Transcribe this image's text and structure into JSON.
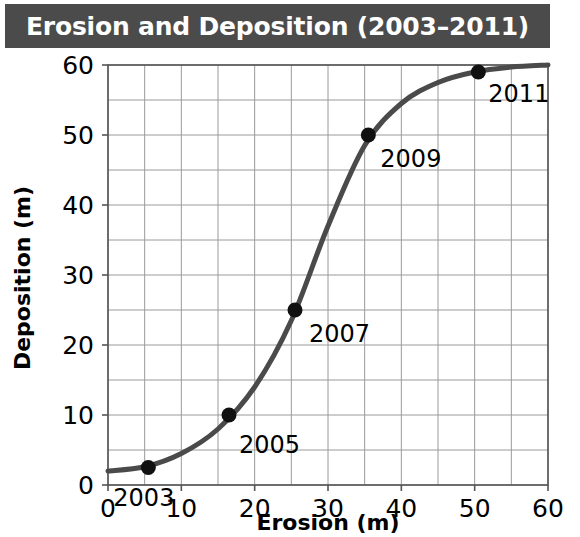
{
  "title": "Erosion and Deposition (2003–2011)",
  "colors": {
    "title_bar_bg": "#4b4b4b",
    "title_text": "#ffffff",
    "curve": "#4a4a4a",
    "point": "#111111",
    "grid": "#9a9a9a",
    "axis": "#555555",
    "background": "#ffffff"
  },
  "chart_data": {
    "type": "line",
    "title": "Erosion and Deposition (2003–2011)",
    "xlabel": "Erosion (m)",
    "ylabel": "Deposition (m)",
    "xlim": [
      0,
      60
    ],
    "ylim": [
      0,
      60
    ],
    "xticks": [
      0,
      10,
      20,
      30,
      40,
      50,
      60
    ],
    "yticks": [
      0,
      10,
      20,
      30,
      40,
      50,
      60
    ],
    "xtick_labels": [
      "0",
      "10",
      "20",
      "30",
      "40",
      "50",
      "60"
    ],
    "ytick_labels": [
      "0",
      "10",
      "20",
      "30",
      "40",
      "50",
      "60"
    ],
    "grid": true,
    "grid_minor_step": 5,
    "legend": "none",
    "series": [
      {
        "name": "Erosion vs Deposition",
        "curve_shape": "sigmoid",
        "x": [
          0,
          5,
          10,
          15,
          20,
          25,
          30,
          35,
          40,
          45,
          50,
          55,
          60
        ],
        "y": [
          2,
          2.6,
          4.5,
          8.0,
          14.0,
          23.5,
          37.0,
          48.5,
          54.5,
          57.5,
          59.0,
          59.7,
          60.0
        ]
      }
    ],
    "points": [
      {
        "label": "2003",
        "x": 5.5,
        "y": 2.5
      },
      {
        "label": "2005",
        "x": 16.5,
        "y": 10
      },
      {
        "label": "2007",
        "x": 25.5,
        "y": 25
      },
      {
        "label": "2009",
        "x": 35.5,
        "y": 50
      },
      {
        "label": "2011",
        "x": 50.5,
        "y": 59
      }
    ]
  }
}
